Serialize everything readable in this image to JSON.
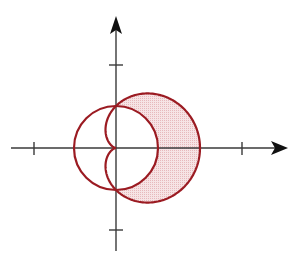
{
  "figure": {
    "origin_px": [
      116,
      148
    ],
    "scale_px": 42,
    "colors": {
      "curve": "#9b1b22",
      "shade": "#f1d3d4",
      "axis": "#333333",
      "background": "#ffffff"
    },
    "curves": [
      {
        "name": "circle",
        "equation": "r = 1"
      },
      {
        "name": "cardioid",
        "equation": "r = 1 + cos θ"
      }
    ],
    "shaded_region": "inside cardioid, outside circle",
    "x_axis": {
      "ticks": [
        -2,
        3
      ],
      "arrow": "right"
    },
    "y_axis": {
      "ticks": [
        2,
        -2
      ],
      "arrow": "up"
    },
    "top_partial_glyph": ""
  }
}
